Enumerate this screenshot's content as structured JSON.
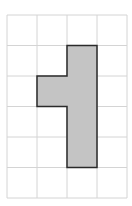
{
  "grid": {
    "cols": 4,
    "rows": 6,
    "origin_x": 7,
    "origin_y": 15,
    "cell_w": 30,
    "cell_h": 30.5,
    "line_color": "#d4d4d4"
  },
  "shape": {
    "fill": "#c4c4c4",
    "stroke": "#2a2a2a",
    "cells": [
      [
        2,
        1
      ],
      [
        1,
        2
      ],
      [
        2,
        2
      ],
      [
        2,
        3
      ],
      [
        2,
        4
      ]
    ],
    "outline": [
      [
        2,
        1
      ],
      [
        3,
        1
      ],
      [
        3,
        5
      ],
      [
        2,
        5
      ],
      [
        2,
        3
      ],
      [
        1,
        3
      ],
      [
        1,
        2
      ],
      [
        2,
        2
      ]
    ]
  }
}
